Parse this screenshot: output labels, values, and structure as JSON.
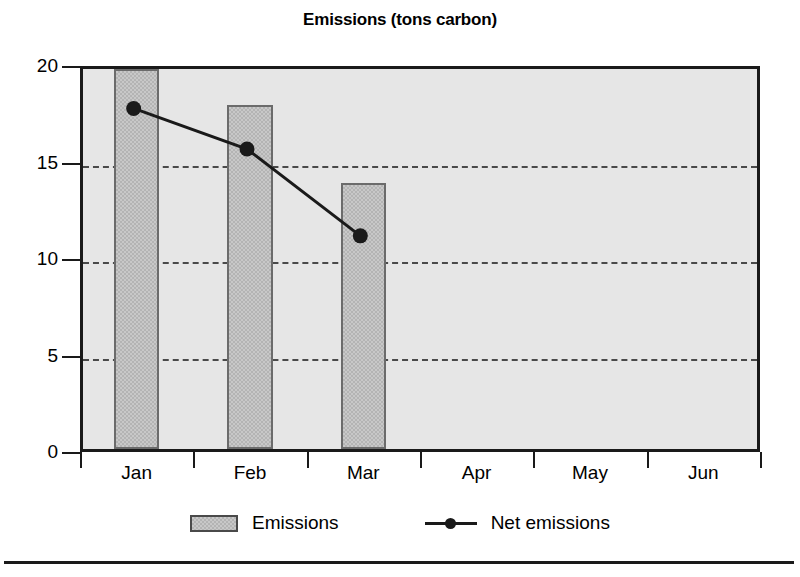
{
  "chart_data": {
    "type": "bar",
    "title": "Emissions (tons carbon)",
    "xlabel": "",
    "ylabel": "",
    "categories": [
      "Jan",
      "Feb",
      "Mar",
      "Apr",
      "May",
      "Jun"
    ],
    "ylim": [
      0,
      20
    ],
    "yticks": [
      0,
      5,
      10,
      15,
      20
    ],
    "ytick_labels": [
      "0",
      "5",
      "10",
      "15",
      "20"
    ],
    "gridlines": [
      5,
      10,
      15
    ],
    "grid": true,
    "legend_position": "bottom",
    "series": [
      {
        "name": "Emissions",
        "type": "bar",
        "values": [
          19.7,
          17.8,
          13.8,
          null,
          null,
          null
        ],
        "color": "#c8c8c8",
        "edge_color": "#6b6b6b"
      },
      {
        "name": "Net emissions",
        "type": "line",
        "values": [
          17.8,
          15.7,
          11.2,
          null,
          null,
          null
        ],
        "color": "#1a1a1a",
        "marker": "circle"
      }
    ]
  },
  "legend": {
    "items": [
      {
        "label": "Emissions",
        "swatch": "bar-swatch"
      },
      {
        "label": "Net emissions",
        "swatch": "line-marker-swatch"
      }
    ]
  },
  "colors": {
    "plot_background": "#e6e6e6",
    "axis": "#1a1a1a",
    "gridline": "#4a4a4a",
    "page_background": "#ffffff"
  }
}
